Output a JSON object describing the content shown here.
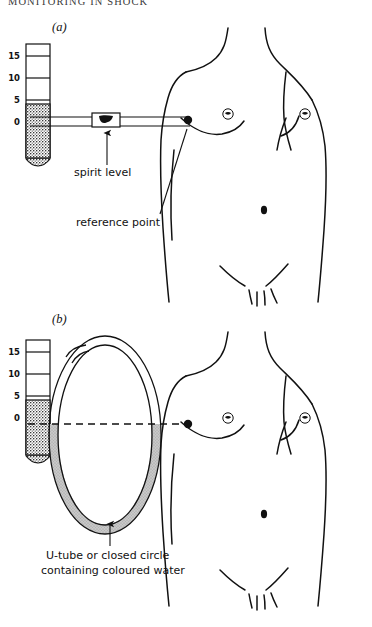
{
  "page": {
    "running_header": "MONITORING IN SHOCK",
    "width": 372,
    "height": 627,
    "background": "#ffffff",
    "ink": "#111111"
  },
  "figure": {
    "type": "medical-line-diagram",
    "panels": [
      {
        "id": "a",
        "label": "(a)",
        "label_x": 52,
        "label_y": 26,
        "manometer": {
          "scale_values": [
            "15",
            "10",
            "5",
            "0"
          ],
          "scale_y": [
            56,
            78,
            100,
            122
          ],
          "tube_x": 38,
          "tube_top": 44,
          "tube_bottom": 158,
          "fluid_top_y": 104,
          "fluid_color": "#3a3a3a"
        },
        "horizontal_tube": {
          "x1": 30,
          "x2": 190,
          "y": 122,
          "spirit_level_x": 105
        },
        "reference_dot": {
          "x": 188,
          "y": 120,
          "r": 4
        },
        "callouts": [
          {
            "name": "spirit-level",
            "text": "spirit level",
            "x": 74,
            "y": 172,
            "arrow_from_x": 108,
            "arrow_from_y": 166,
            "arrow_to_x": 108,
            "arrow_to_y": 132
          },
          {
            "name": "reference-point",
            "text": "reference point",
            "x": 76,
            "y": 222,
            "arrow_from_x": 162,
            "arrow_from_y": 216,
            "arrow_to_x": 186,
            "arrow_to_y": 128
          }
        ]
      },
      {
        "id": "b",
        "label": "(b)",
        "label_x": 52,
        "label_y": 318,
        "manometer": {
          "scale_values": [
            "15",
            "10",
            "5",
            "0"
          ],
          "scale_y": [
            352,
            374,
            396,
            418
          ],
          "tube_x": 38,
          "tube_top": 340,
          "tube_bottom": 455,
          "fluid_top_y": 400,
          "fluid_color": "#3a3a3a"
        },
        "u_tube": {
          "shape": "closed-oval-loop",
          "cx": 105,
          "cy": 435,
          "rx": 47,
          "ry": 90,
          "water_level_y": 424,
          "water_color": "#b8b8b8"
        },
        "reference_line": {
          "x1": 28,
          "x2": 196,
          "y": 424,
          "style": "dashed"
        },
        "reference_dot": {
          "x": 188,
          "y": 424,
          "r": 4
        },
        "callouts": [
          {
            "name": "u-tube-caption-line1",
            "text": "U-tube or closed circle",
            "x": 46,
            "y": 556
          },
          {
            "name": "u-tube-caption-line2",
            "text": "containing coloured water",
            "x": 41,
            "y": 571
          }
        ],
        "caption_arrow": {
          "from_x": 110,
          "from_y": 546,
          "to_x": 110,
          "to_y": 523
        }
      }
    ],
    "torso": {
      "description": "anterior line drawing of male chest and abdomen",
      "features": [
        "neck",
        "shoulders",
        "pectoral-folds",
        "nipples",
        "navel",
        "inguinal-creases",
        "pubic-hair"
      ]
    }
  }
}
